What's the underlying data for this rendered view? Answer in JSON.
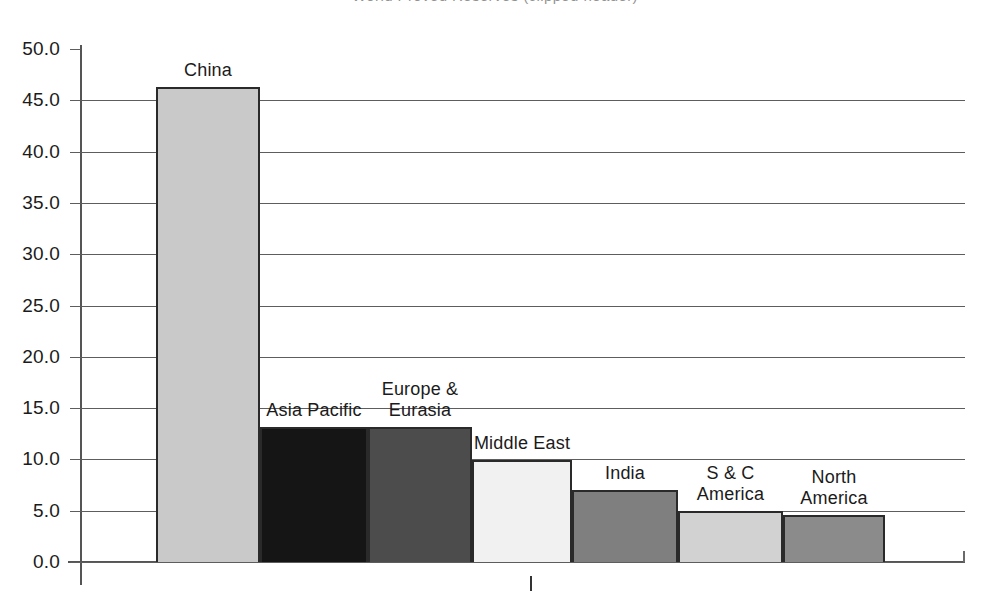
{
  "title": {
    "text": "World Proved Reserves (clipped header)",
    "visible_clipped": true
  },
  "chart_data": {
    "type": "bar",
    "title": "",
    "xlabel": "",
    "ylabel": "",
    "ylim": [
      0.0,
      50.0
    ],
    "ytick_step": 5.0,
    "grid": true,
    "legend": "none",
    "categories": [
      "China",
      "Asia Pacific",
      "Europe &\nEurasia",
      "Middle East",
      "India",
      "S & C\nAmerica",
      "North\nAmerica"
    ],
    "values": [
      46.3,
      13.2,
      13.2,
      9.9,
      7.0,
      5.0,
      4.6
    ],
    "bar_colors": [
      "#c9c9c9",
      "#151515",
      "#4c4c4c",
      "#f1f1f1",
      "#7f7f7f",
      "#d2d2d2",
      "#8b8b8b"
    ],
    "bar_edge_color": "#2a2a2a",
    "ytick_labels": [
      "50.0",
      "45.0",
      "40.0",
      "35.0",
      "30.0",
      "25.0",
      "20.0",
      "15.0",
      "10.0",
      "5.0",
      "0.0"
    ],
    "ytick_values": [
      50.0,
      45.0,
      40.0,
      35.0,
      30.0,
      25.0,
      20.0,
      15.0,
      10.0,
      5.0,
      0.0
    ]
  },
  "axis": {
    "y_line_color": "#555555",
    "x_line_color": "#555555",
    "grid_color": "#5d5d5d"
  }
}
